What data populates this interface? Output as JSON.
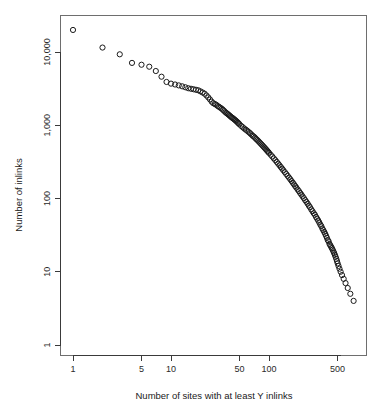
{
  "figure": {
    "background": "#ffffff",
    "plot_frame_color": "#6e6e6e",
    "point_color": "#1a1a1a",
    "point_shape": "open-circle",
    "point_radius_px": 2.6
  },
  "chart_data": {
    "type": "scatter",
    "title": "",
    "subtitle": "",
    "xlabel": "Number of sites with at least Y inlinks",
    "ylabel": "Number of inlinks",
    "xscale": "log",
    "yscale": "log",
    "grid": false,
    "legend": null,
    "xlim": [
      0.85,
      900
    ],
    "ylim": [
      0.8,
      26000
    ],
    "xticks": [
      1,
      5,
      10,
      50,
      100,
      500
    ],
    "xticklabels": [
      "1",
      "5",
      "10",
      "50",
      "100",
      "500"
    ],
    "yticks": [
      1,
      10,
      100,
      1000,
      10000
    ],
    "yticklabels": [
      "1",
      "10",
      "100",
      "1,000",
      "10,000"
    ],
    "x": [
      1,
      2,
      3,
      4,
      5,
      6,
      7,
      8,
      9,
      10,
      11,
      12,
      13,
      14,
      15,
      16,
      17,
      18,
      19,
      20,
      21,
      22,
      23,
      24,
      25,
      26,
      27,
      28,
      29,
      30,
      31,
      32,
      33,
      34,
      35,
      36,
      37,
      38,
      39,
      40,
      41,
      42,
      43,
      44,
      45,
      46,
      47,
      48,
      49,
      50,
      52,
      54,
      56,
      58,
      60,
      62,
      64,
      66,
      68,
      70,
      72,
      74,
      76,
      78,
      80,
      82,
      84,
      86,
      88,
      90,
      92,
      94,
      96,
      98,
      100,
      104,
      108,
      112,
      116,
      120,
      124,
      128,
      132,
      136,
      140,
      145,
      150,
      155,
      160,
      165,
      170,
      175,
      180,
      185,
      190,
      196,
      202,
      208,
      214,
      220,
      227,
      234,
      241,
      248,
      255,
      262,
      270,
      278,
      286,
      294,
      302,
      310,
      318,
      326,
      334,
      342,
      350,
      358,
      366,
      374,
      382,
      390,
      398,
      406,
      414,
      422,
      430,
      438,
      446,
      454,
      462,
      470,
      478,
      486,
      494,
      502,
      512,
      524,
      538,
      556,
      578,
      604,
      636,
      676,
      730
    ],
    "y": [
      20000,
      11500,
      9300,
      7100,
      6700,
      6300,
      5500,
      4600,
      3900,
      3700,
      3600,
      3500,
      3400,
      3300,
      3200,
      3150,
      3100,
      3050,
      3000,
      2900,
      2800,
      2700,
      2550,
      2400,
      2250,
      2100,
      2000,
      1950,
      1900,
      1830,
      1780,
      1730,
      1680,
      1620,
      1560,
      1500,
      1460,
      1420,
      1380,
      1340,
      1300,
      1270,
      1240,
      1210,
      1180,
      1150,
      1120,
      1090,
      1060,
      1030,
      980,
      940,
      900,
      870,
      840,
      810,
      780,
      750,
      720,
      700,
      675,
      650,
      628,
      606,
      585,
      565,
      546,
      528,
      510,
      494,
      478,
      463,
      448,
      434,
      420,
      396,
      374,
      353,
      334,
      316,
      299,
      284,
      269,
      256,
      243,
      229,
      216,
      204,
      193,
      183,
      173,
      164,
      156,
      148,
      141,
      133,
      126,
      119,
      113,
      107,
      101,
      95,
      90,
      85,
      80,
      76,
      71,
      67,
      63,
      60,
      56,
      53,
      50,
      47,
      44,
      42,
      39,
      37,
      35,
      33,
      31,
      29,
      27,
      26,
      24,
      23,
      22,
      21,
      20,
      19,
      18,
      17,
      16,
      15,
      14,
      13,
      12,
      11,
      10,
      9,
      8,
      7,
      6,
      5,
      4,
      3,
      2,
      1
    ],
    "point_count": 163
  }
}
